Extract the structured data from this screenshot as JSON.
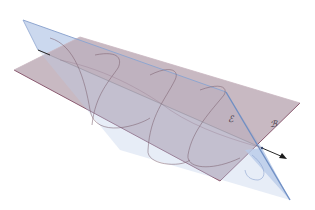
{
  "figure": {
    "labels": {
      "plane_blue": "ℰ",
      "plane_pink": "ℬ"
    },
    "colors": {
      "background": "#ffffff",
      "plane_blue_fill": "#b9cbe8",
      "plane_blue_edge": "#6f8fc4",
      "plane_pink_fill": "#bca9b4",
      "plane_pink_edge": "#8a5a70",
      "curve": "#7d6272",
      "axis": "#2a2a2a"
    }
  }
}
